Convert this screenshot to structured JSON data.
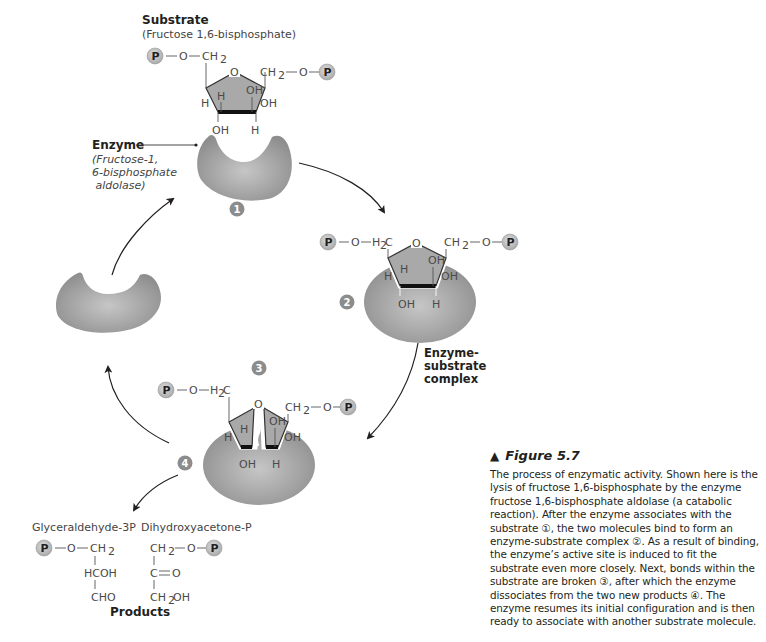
{
  "substrate": {
    "title": "Substrate",
    "subtitle": "(Fructose 1,6-bisphosphate)"
  },
  "enzyme": {
    "title": "Enzyme",
    "line1": "(Fructose-1,",
    "line2": "6-bisphosphate",
    "line3": " aldolase)"
  },
  "complex_label": {
    "line1": "Enzyme-",
    "line2": "substrate",
    "line3": "complex"
  },
  "steps": [
    "1",
    "2",
    "3",
    "4"
  ],
  "chem": {
    "P": "P",
    "O": "O",
    "CH2": "CH",
    "H2C": "H",
    "OH": "OH",
    "H": "H",
    "sub2": "2",
    "C": "C"
  },
  "products": {
    "label": "Products",
    "glyceraldehyde": {
      "name": "Glyceraldehyde-3P",
      "row2": "HCOH",
      "row3": "CHO"
    },
    "dihydroxyacetone": {
      "name": "Dihydroxyacetone-P",
      "row2": "C=O",
      "row3": "CH",
      "row3b": "OH"
    }
  },
  "caption": {
    "marker": "▲",
    "title": "Figure 5.7",
    "body": "The process of enzymatic activity. Shown here is the lysis of fructose 1,6-bisphosphate by the enzyme fructose 1,6-bisphosphate aldolase (a catabolic reaction). After the enzyme associates with the substrate ①, the two molecules bind to form an enzyme-substrate complex ②. As a result of binding, the enzyme’s active site is induced to fit the substrate even more closely. Next, bonds within the substrate are broken ③, after which the enzyme dissociates from the two new products ④. The enzyme resumes its initial configuration and is then ready to associate with another substrate molecule."
  },
  "colors": {
    "enzyme": "#9a9a9a",
    "enzyme_light": "#c4c4c4",
    "ring": "#a8a8a8",
    "phosphate": "#c9c9c9",
    "step_badge": "#8c8c8c",
    "arrow": "#231f20"
  }
}
